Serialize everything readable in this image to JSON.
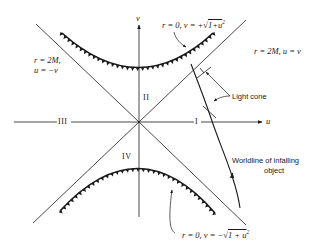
{
  "figure": {
    "axes": {
      "horizontal_label": "u",
      "vertical_label": "v"
    },
    "regions": {
      "I": "I",
      "II": "II",
      "III": "III",
      "IV": "IV"
    },
    "annotations": {
      "future_singularity": "r = 0, v = +√(1+u²)",
      "future_singularity_lhs": "r = 0, v = +",
      "future_singularity_rad": "1+u",
      "past_singularity_lhs": "r = 0, v = −",
      "past_singularity_rad": "1 + u",
      "horizon_right_label": "r = 2M, u = v",
      "horizon_left_line1": "r = 2M,",
      "horizon_left_line2": "u = −v",
      "light_cone": "Light cone",
      "worldline_line1": "Worldline of infalling",
      "worldline_line2": "object",
      "superscript_2": "2"
    },
    "colors": {
      "ink": "#1a1a1a",
      "background": "#ffffff"
    }
  }
}
